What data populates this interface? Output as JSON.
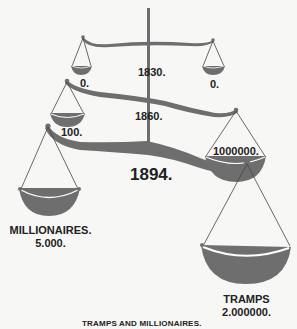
{
  "diagram": {
    "colors": {
      "beam": "#6e6e6e",
      "line": "#444444",
      "rim": "#ffffff",
      "text": "#222222",
      "background": "#f7f7f5"
    },
    "years": [
      {
        "label": "1830.",
        "left_value": "0.",
        "right_value": "0."
      },
      {
        "label": "1860.",
        "left_value": "100.",
        "right_value": "1000000."
      },
      {
        "label": "1894.",
        "left_value": "5.000.",
        "right_value": "2.000000."
      }
    ],
    "left_group": {
      "name": "MILLIONAIRES.",
      "value": "5.000."
    },
    "right_group": {
      "name": "TRAMPS",
      "value": "2.000000."
    },
    "caption": "TRAMPS AND MILLIONAIRES."
  }
}
